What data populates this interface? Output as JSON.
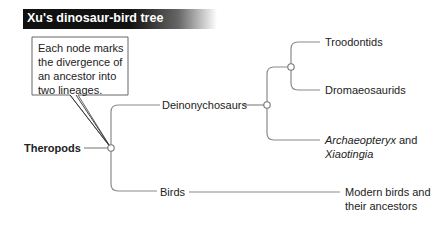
{
  "title": "Xu's dinosaur-bird tree",
  "callout": {
    "lines": [
      "Each node marks",
      "the divergence of",
      "an ancestor into",
      "two lineages."
    ]
  },
  "tree": {
    "root": "Theropods",
    "branches": {
      "deinonychosaurs": "Deinonychosaurs",
      "birds": "Birds",
      "troodontids": "Troodontids",
      "dromaeosaurids": "Dromaeosaurids",
      "archaeopteryx_italic": "Archaeopteryx",
      "archaeopteryx_and": " and",
      "xiaotingia": "Xiaotingia",
      "modern_birds_line1": "Modern birds and",
      "modern_birds_line2": "their ancestors"
    }
  },
  "colors": {
    "line": "#8a8a8a",
    "title_bg": "#111111",
    "title_text": "#ffffff",
    "callout_border": "#666666"
  }
}
